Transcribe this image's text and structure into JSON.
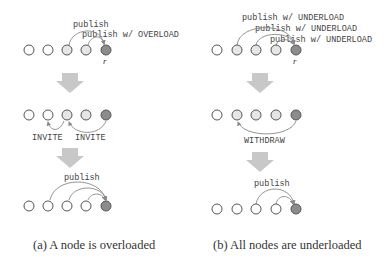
{
  "panels": {
    "a": {
      "caption": "(a) A node is overloaded",
      "step1": {
        "labels": [
          "publish",
          "publish w/ OVERLOAD"
        ],
        "node_label": "r"
      },
      "step2": {
        "labels": [
          "INVITE",
          "INVITE"
        ]
      },
      "step3": {
        "labels": [
          "publish"
        ]
      }
    },
    "b": {
      "caption": "(b) All nodes are underloaded",
      "step1": {
        "labels": [
          "publish w/ UNDERLOAD",
          "publish w/ UNDERLOAD",
          "publish w/ UNDERLOAD"
        ],
        "node_label": "r"
      },
      "step2": {
        "labels": [
          "WITHDRAW"
        ]
      },
      "step3": {
        "labels": [
          "publish"
        ]
      }
    }
  },
  "colors": {
    "node_empty": "#ffffff",
    "node_light": "#e6e6e6",
    "node_root": "#8c8c8c",
    "arrow": "#c8c8c8",
    "edge": "#888888"
  }
}
